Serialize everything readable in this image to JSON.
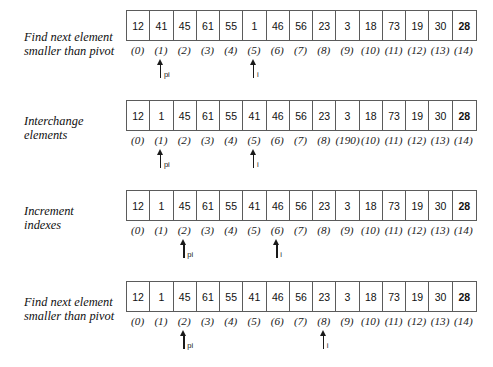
{
  "figure": {
    "kind": "quicksort-partition-trace-diagram",
    "array_length": 15,
    "cell_count": 15,
    "pointer_names": {
      "pivot_index": "pi",
      "scan_index": "i"
    },
    "steps": [
      {
        "label_line1": "Find next element",
        "label_line2": "smaller than pivot",
        "values": [
          "12",
          "41",
          "45",
          "61",
          "55",
          "1",
          "46",
          "56",
          "23",
          "3",
          "18",
          "73",
          "19",
          "30",
          "28"
        ],
        "bold_cells": [
          14
        ],
        "indexes": [
          "(0)",
          "(1)",
          "(2)",
          "(3)",
          "(4)",
          "(5)",
          "(6)",
          "(7)",
          "(8)",
          "(9)",
          "(10)",
          "(11)",
          "(12)",
          "(13)",
          "(14)"
        ],
        "pointers": [
          {
            "name": "pi",
            "label": "pi",
            "cell": 1
          },
          {
            "name": "i",
            "label": "i",
            "cell": 5
          }
        ]
      },
      {
        "label_line1": "Interchange",
        "label_line2": "elements",
        "values": [
          "12",
          "1",
          "45",
          "61",
          "55",
          "41",
          "46",
          "56",
          "23",
          "3",
          "18",
          "73",
          "19",
          "30",
          "28"
        ],
        "bold_cells": [
          14
        ],
        "indexes": [
          "(0)",
          "(1)",
          "(2)",
          "(3)",
          "(4)",
          "(5)",
          "(6)",
          "(7)",
          "(8)",
          "(190)",
          "(10)",
          "(11)",
          "(12)",
          "(13)",
          "(14)"
        ],
        "pointers": [
          {
            "name": "pi",
            "label": "pi",
            "cell": 1
          },
          {
            "name": "i",
            "label": "i",
            "cell": 5
          }
        ]
      },
      {
        "label_line1": "Increment",
        "label_line2": "indexes",
        "values": [
          "12",
          "1",
          "45",
          "61",
          "55",
          "41",
          "46",
          "56",
          "23",
          "3",
          "18",
          "73",
          "19",
          "30",
          "28"
        ],
        "bold_cells": [
          14
        ],
        "indexes": [
          "(0)",
          "(1)",
          "(2)",
          "(3)",
          "(4)",
          "(5)",
          "(6)",
          "(7)",
          "(8)",
          "(9)",
          "(10)",
          "(11)",
          "(12)",
          "(13)",
          "(14)"
        ],
        "pointers": [
          {
            "name": "pi",
            "label": "pi",
            "cell": 2
          },
          {
            "name": "i",
            "label": "i",
            "cell": 6
          }
        ]
      },
      {
        "label_line1": "Find next element",
        "label_line2": "smaller than pivot",
        "values": [
          "12",
          "1",
          "45",
          "61",
          "55",
          "41",
          "46",
          "56",
          "23",
          "3",
          "18",
          "73",
          "19",
          "30",
          "28"
        ],
        "bold_cells": [
          14
        ],
        "indexes": [
          "(0)",
          "(1)",
          "(2)",
          "(3)",
          "(4)",
          "(5)",
          "(6)",
          "(7)",
          "(8)",
          "(9)",
          "(10)",
          "(11)",
          "(12)",
          "(13)",
          "(14)"
        ],
        "pointers": [
          {
            "name": "pi",
            "label": "pi",
            "cell": 2
          },
          {
            "name": "i",
            "label": "i",
            "cell": 8
          }
        ]
      }
    ]
  },
  "colors": {
    "background": "#ffffff",
    "border": "#5b5b5b",
    "text": "#111111",
    "pointer": "#1a1a1a"
  }
}
